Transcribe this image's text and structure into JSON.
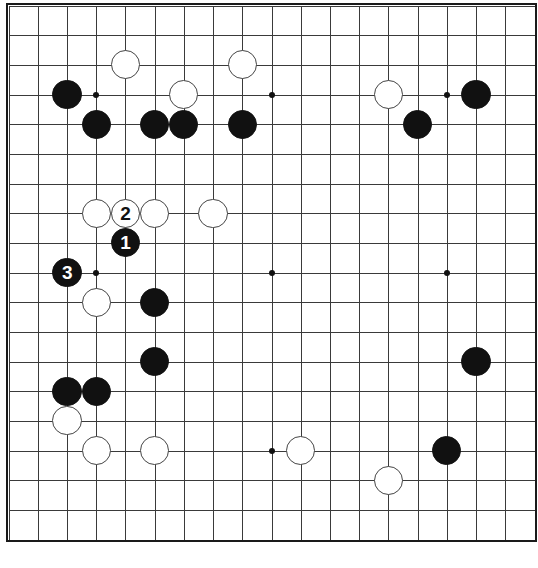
{
  "diagram": {
    "type": "go-board",
    "board_size": 19,
    "background_color": "#ffffff",
    "line_color": "#3a3a3a",
    "border_color": "#1a1a1a",
    "black_color": "#111111",
    "white_color": "#ffffff",
    "star_points": [
      {
        "col": 3,
        "row": 3
      },
      {
        "col": 9,
        "row": 3
      },
      {
        "col": 15,
        "row": 3
      },
      {
        "col": 3,
        "row": 9
      },
      {
        "col": 9,
        "row": 9
      },
      {
        "col": 15,
        "row": 9
      },
      {
        "col": 3,
        "row": 15
      },
      {
        "col": 9,
        "row": 15
      },
      {
        "col": 15,
        "row": 15
      }
    ],
    "stones": [
      {
        "col": 4,
        "row": 2,
        "color": "white",
        "label": ""
      },
      {
        "col": 8,
        "row": 2,
        "color": "white",
        "label": ""
      },
      {
        "col": 2,
        "row": 3,
        "color": "black",
        "label": ""
      },
      {
        "col": 6,
        "row": 3,
        "color": "white",
        "label": ""
      },
      {
        "col": 13,
        "row": 3,
        "color": "white",
        "label": ""
      },
      {
        "col": 16,
        "row": 3,
        "color": "black",
        "label": ""
      },
      {
        "col": 3,
        "row": 4,
        "color": "black",
        "label": ""
      },
      {
        "col": 5,
        "row": 4,
        "color": "black",
        "label": ""
      },
      {
        "col": 6,
        "row": 4,
        "color": "black",
        "label": ""
      },
      {
        "col": 8,
        "row": 4,
        "color": "black",
        "label": ""
      },
      {
        "col": 14,
        "row": 4,
        "color": "black",
        "label": ""
      },
      {
        "col": 3,
        "row": 7,
        "color": "white",
        "label": ""
      },
      {
        "col": 4,
        "row": 7,
        "color": "white",
        "label": "2"
      },
      {
        "col": 5,
        "row": 7,
        "color": "white",
        "label": ""
      },
      {
        "col": 7,
        "row": 7,
        "color": "white",
        "label": ""
      },
      {
        "col": 4,
        "row": 8,
        "color": "black",
        "label": "1"
      },
      {
        "col": 2,
        "row": 9,
        "color": "black",
        "label": "3"
      },
      {
        "col": 3,
        "row": 10,
        "color": "white",
        "label": ""
      },
      {
        "col": 5,
        "row": 10,
        "color": "black",
        "label": ""
      },
      {
        "col": 5,
        "row": 12,
        "color": "black",
        "label": ""
      },
      {
        "col": 16,
        "row": 12,
        "color": "black",
        "label": ""
      },
      {
        "col": 2,
        "row": 13,
        "color": "black",
        "label": ""
      },
      {
        "col": 3,
        "row": 13,
        "color": "black",
        "label": ""
      },
      {
        "col": 2,
        "row": 14,
        "color": "white",
        "label": ""
      },
      {
        "col": 3,
        "row": 15,
        "color": "white",
        "label": ""
      },
      {
        "col": 5,
        "row": 15,
        "color": "white",
        "label": ""
      },
      {
        "col": 10,
        "row": 15,
        "color": "white",
        "label": ""
      },
      {
        "col": 15,
        "row": 15,
        "color": "black",
        "label": ""
      },
      {
        "col": 13,
        "row": 16,
        "color": "white",
        "label": ""
      }
    ],
    "move_sequence": [
      {
        "number": "1",
        "color": "black",
        "col": 4,
        "row": 8
      },
      {
        "number": "2",
        "color": "white",
        "col": 4,
        "row": 7
      },
      {
        "number": "3",
        "color": "black",
        "col": 2,
        "row": 9
      }
    ]
  }
}
